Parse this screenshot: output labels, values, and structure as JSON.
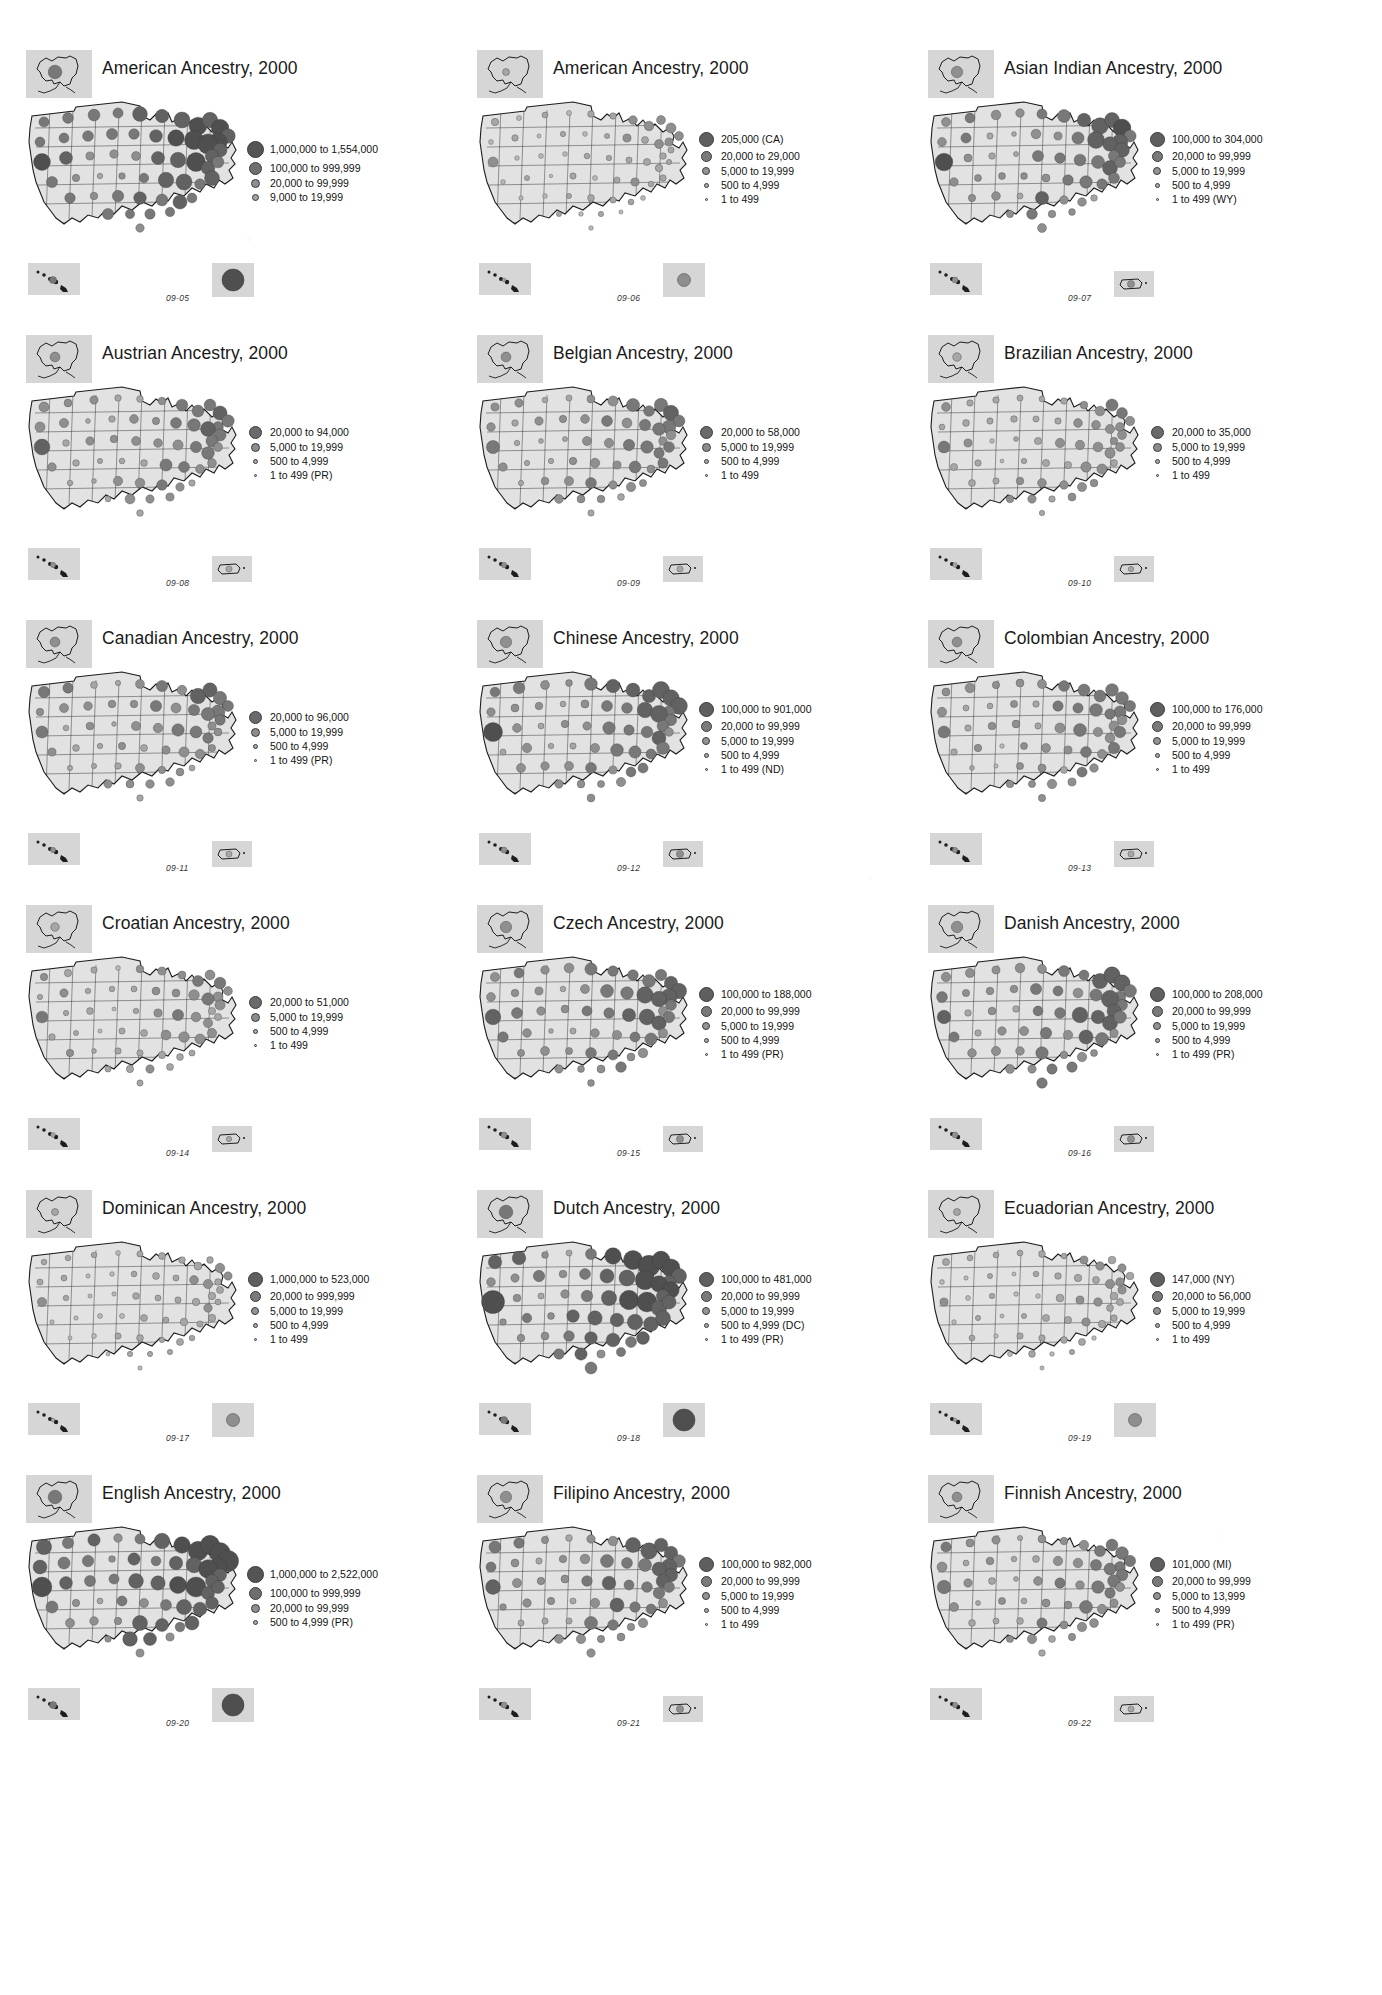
{
  "document": {
    "kind": "atlas-page",
    "description": "Grid of 18 proportional-symbol maps of U.S. ancestry populations by state, Census 2000"
  },
  "panels": [
    {
      "id": "09-05",
      "title": "American Ancestry, 2000",
      "fig_num": "09-05",
      "legend": [
        {
          "label": "1,000,000 to 1,554,000",
          "size": 17,
          "color": "#555555"
        },
        {
          "label": "100,000 to 999,999",
          "size": 13,
          "color": "#6e6e6e"
        },
        {
          "label": "20,000 to 99,999",
          "size": 9,
          "color": "#8e8e8e"
        },
        {
          "label": "9,000 to 19,999",
          "size": 7,
          "color": "#a3a3a3"
        }
      ],
      "insets": [
        "hawaii",
        "puerto-rico"
      ],
      "density": "very-high"
    },
    {
      "id": "09-06",
      "title": "American Ancestry, 2000",
      "fig_num": "09-06",
      "legend": [
        {
          "label": "205,000 (CA)",
          "size": 15,
          "color": "#5f5f5f"
        },
        {
          "label": "20,000 to 29,000",
          "size": 11,
          "color": "#7a7a7a"
        },
        {
          "label": "5,000 to 19,999",
          "size": 8,
          "color": "#949494"
        },
        {
          "label": "500 to 4,999",
          "size": 5,
          "color": "#ababab"
        },
        {
          "label": "1 to 499",
          "size": 3,
          "color": "#bdbdbd"
        }
      ],
      "insets": [
        "hawaii",
        "puerto-rico"
      ],
      "density": "low"
    },
    {
      "id": "09-07",
      "title": "Asian Indian Ancestry, 2000",
      "fig_num": "09-07",
      "legend": [
        {
          "label": "100,000 to 304,000",
          "size": 15,
          "color": "#5f5f5f"
        },
        {
          "label": "20,000 to 99,999",
          "size": 11,
          "color": "#7a7a7a"
        },
        {
          "label": "5,000 to 19,999",
          "size": 8,
          "color": "#949494"
        },
        {
          "label": "500 to 4,999",
          "size": 5,
          "color": "#ababab"
        },
        {
          "label": "1 to 499 (WY)",
          "size": 3,
          "color": "#bdbdbd"
        }
      ],
      "insets": [
        "hawaii",
        "puerto-rico"
      ],
      "density": "medium-high"
    },
    {
      "id": "09-08",
      "title": "Austrian Ancestry, 2000",
      "fig_num": "09-08",
      "legend": [
        {
          "label": "20,000 to 94,000",
          "size": 13,
          "color": "#6a6a6a"
        },
        {
          "label": "5,000 to 19,999",
          "size": 9,
          "color": "#8c8c8c"
        },
        {
          "label": "500 to 4,999",
          "size": 5,
          "color": "#ababab"
        },
        {
          "label": "1 to 499 (PR)",
          "size": 3,
          "color": "#bdbdbd"
        }
      ],
      "insets": [
        "hawaii",
        "puerto-rico"
      ],
      "density": "medium"
    },
    {
      "id": "09-09",
      "title": "Belgian Ancestry, 2000",
      "fig_num": "09-09",
      "legend": [
        {
          "label": "20,000 to 58,000",
          "size": 13,
          "color": "#6a6a6a"
        },
        {
          "label": "5,000 to 19,999",
          "size": 9,
          "color": "#8c8c8c"
        },
        {
          "label": "500 to 4,999",
          "size": 5,
          "color": "#ababab"
        },
        {
          "label": "1 to 499",
          "size": 3,
          "color": "#bdbdbd"
        }
      ],
      "insets": [
        "hawaii",
        "puerto-rico"
      ],
      "density": "medium"
    },
    {
      "id": "09-10",
      "title": "Brazilian Ancestry, 2000",
      "fig_num": "09-10",
      "legend": [
        {
          "label": "20,000 to 35,000",
          "size": 13,
          "color": "#6a6a6a"
        },
        {
          "label": "5,000 to 19,999",
          "size": 9,
          "color": "#8c8c8c"
        },
        {
          "label": "500 to 4,999",
          "size": 5,
          "color": "#ababab"
        },
        {
          "label": "1 to 499",
          "size": 3,
          "color": "#bdbdbd"
        }
      ],
      "insets": [
        "hawaii",
        "puerto-rico"
      ],
      "density": "medium-low"
    },
    {
      "id": "09-11",
      "title": "Canadian Ancestry, 2000",
      "fig_num": "09-11",
      "legend": [
        {
          "label": "20,000 to 96,000",
          "size": 13,
          "color": "#6a6a6a"
        },
        {
          "label": "5,000 to 19,999",
          "size": 9,
          "color": "#8c8c8c"
        },
        {
          "label": "500 to 4,999",
          "size": 5,
          "color": "#ababab"
        },
        {
          "label": "1 to 499 (PR)",
          "size": 3,
          "color": "#bdbdbd"
        }
      ],
      "insets": [
        "hawaii",
        "puerto-rico"
      ],
      "density": "medium"
    },
    {
      "id": "09-12",
      "title": "Chinese Ancestry, 2000",
      "fig_num": "09-12",
      "legend": [
        {
          "label": "100,000 to 901,000",
          "size": 15,
          "color": "#5f5f5f"
        },
        {
          "label": "20,000 to 99,999",
          "size": 11,
          "color": "#7a7a7a"
        },
        {
          "label": "5,000 to 19,999",
          "size": 8,
          "color": "#949494"
        },
        {
          "label": "500 to 4,999",
          "size": 5,
          "color": "#ababab"
        },
        {
          "label": "1 to 499 (ND)",
          "size": 3,
          "color": "#bdbdbd"
        }
      ],
      "insets": [
        "hawaii",
        "puerto-rico"
      ],
      "density": "medium-high"
    },
    {
      "id": "09-13",
      "title": "Colombian Ancestry, 2000",
      "fig_num": "09-13",
      "legend": [
        {
          "label": "100,000 to 176,000",
          "size": 15,
          "color": "#5f5f5f"
        },
        {
          "label": "20,000 to 99,999",
          "size": 11,
          "color": "#7a7a7a"
        },
        {
          "label": "5,000 to 19,999",
          "size": 8,
          "color": "#949494"
        },
        {
          "label": "500 to 4,999",
          "size": 5,
          "color": "#ababab"
        },
        {
          "label": "1 to 499",
          "size": 3,
          "color": "#bdbdbd"
        }
      ],
      "insets": [
        "hawaii",
        "puerto-rico"
      ],
      "density": "medium"
    },
    {
      "id": "09-14",
      "title": "Croatian Ancestry, 2000",
      "fig_num": "09-14",
      "legend": [
        {
          "label": "20,000 to 51,000",
          "size": 13,
          "color": "#6a6a6a"
        },
        {
          "label": "5,000 to 19,999",
          "size": 9,
          "color": "#8c8c8c"
        },
        {
          "label": "500 to 4,999",
          "size": 5,
          "color": "#ababab"
        },
        {
          "label": "1 to 499",
          "size": 3,
          "color": "#bdbdbd"
        }
      ],
      "insets": [
        "hawaii",
        "puerto-rico"
      ],
      "density": "medium-low"
    },
    {
      "id": "09-15",
      "title": "Czech Ancestry, 2000",
      "fig_num": "09-15",
      "legend": [
        {
          "label": "100,000 to 188,000",
          "size": 15,
          "color": "#5f5f5f"
        },
        {
          "label": "20,000 to 99,999",
          "size": 11,
          "color": "#7a7a7a"
        },
        {
          "label": "5,000 to 19,999",
          "size": 8,
          "color": "#949494"
        },
        {
          "label": "500 to 4,999",
          "size": 5,
          "color": "#ababab"
        },
        {
          "label": "1 to 499 (PR)",
          "size": 3,
          "color": "#bdbdbd"
        }
      ],
      "insets": [
        "hawaii",
        "puerto-rico"
      ],
      "density": "medium-high"
    },
    {
      "id": "09-16",
      "title": "Danish Ancestry, 2000",
      "fig_num": "09-16",
      "legend": [
        {
          "label": "100,000 to 208,000",
          "size": 15,
          "color": "#5f5f5f"
        },
        {
          "label": "20,000 to 99,999",
          "size": 11,
          "color": "#7a7a7a"
        },
        {
          "label": "5,000 to 19,999",
          "size": 8,
          "color": "#949494"
        },
        {
          "label": "500 to 4,999",
          "size": 5,
          "color": "#ababab"
        },
        {
          "label": "1 to 499 (PR)",
          "size": 3,
          "color": "#bdbdbd"
        }
      ],
      "insets": [
        "hawaii",
        "puerto-rico"
      ],
      "density": "medium-high"
    },
    {
      "id": "09-17",
      "title": "Dominican Ancestry, 2000",
      "fig_num": "09-17",
      "legend": [
        {
          "label": "1,000,000 to 523,000",
          "size": 15,
          "color": "#5f5f5f"
        },
        {
          "label": "20,000 to 999,999",
          "size": 11,
          "color": "#7a7a7a"
        },
        {
          "label": "5,000 to 19,999",
          "size": 8,
          "color": "#949494"
        },
        {
          "label": "500 to 4,999",
          "size": 5,
          "color": "#ababab"
        },
        {
          "label": "1 to 499",
          "size": 3,
          "color": "#bdbdbd"
        }
      ],
      "insets": [
        "hawaii",
        "puerto-rico"
      ],
      "density": "low"
    },
    {
      "id": "09-18",
      "title": "Dutch Ancestry, 2000",
      "fig_num": "09-18",
      "legend": [
        {
          "label": "100,000 to 481,000",
          "size": 15,
          "color": "#5f5f5f"
        },
        {
          "label": "20,000 to 99,999",
          "size": 11,
          "color": "#7a7a7a"
        },
        {
          "label": "5,000 to 19,999",
          "size": 8,
          "color": "#949494"
        },
        {
          "label": "500 to 4,999 (DC)",
          "size": 5,
          "color": "#ababab"
        },
        {
          "label": "1 to 499 (PR)",
          "size": 3,
          "color": "#bdbdbd"
        }
      ],
      "insets": [
        "hawaii",
        "puerto-rico"
      ],
      "density": "very-high"
    },
    {
      "id": "09-19",
      "title": "Ecuadorian Ancestry, 2000",
      "fig_num": "09-19",
      "legend": [
        {
          "label": "147,000 (NY)",
          "size": 15,
          "color": "#5f5f5f"
        },
        {
          "label": "20,000 to 56,000",
          "size": 11,
          "color": "#7a7a7a"
        },
        {
          "label": "5,000 to 19,999",
          "size": 8,
          "color": "#949494"
        },
        {
          "label": "500 to 4,999",
          "size": 5,
          "color": "#ababab"
        },
        {
          "label": "1 to 499",
          "size": 3,
          "color": "#bdbdbd"
        }
      ],
      "insets": [
        "hawaii",
        "puerto-rico"
      ],
      "density": "low"
    },
    {
      "id": "09-20",
      "title": "English Ancestry, 2000",
      "fig_num": "09-20",
      "legend": [
        {
          "label": "1,000,000 to 2,522,000",
          "size": 17,
          "color": "#555555"
        },
        {
          "label": "100,000 to 999,999",
          "size": 13,
          "color": "#6e6e6e"
        },
        {
          "label": "20,000 to 99,999",
          "size": 9,
          "color": "#8e8e8e"
        },
        {
          "label": "500 to 4,999 (PR)",
          "size": 5,
          "color": "#ababab"
        }
      ],
      "insets": [
        "hawaii",
        "puerto-rico"
      ],
      "density": "very-high"
    },
    {
      "id": "09-21",
      "title": "Filipino Ancestry, 2000",
      "fig_num": "09-21",
      "legend": [
        {
          "label": "100,000 to 982,000",
          "size": 15,
          "color": "#5f5f5f"
        },
        {
          "label": "20,000 to 99,999",
          "size": 11,
          "color": "#7a7a7a"
        },
        {
          "label": "5,000 to 19,999",
          "size": 8,
          "color": "#949494"
        },
        {
          "label": "500 to 4,999",
          "size": 5,
          "color": "#ababab"
        },
        {
          "label": "1 to 499",
          "size": 3,
          "color": "#bdbdbd"
        }
      ],
      "insets": [
        "hawaii",
        "puerto-rico"
      ],
      "density": "medium-high"
    },
    {
      "id": "09-22",
      "title": "Finnish Ancestry, 2000",
      "fig_num": "09-22",
      "legend": [
        {
          "label": "101,000 (MI)",
          "size": 15,
          "color": "#5f5f5f"
        },
        {
          "label": "20,000 to 99,999",
          "size": 11,
          "color": "#7a7a7a"
        },
        {
          "label": "5,000 to 13,999",
          "size": 8,
          "color": "#949494"
        },
        {
          "label": "500 to 4,999",
          "size": 5,
          "color": "#ababab"
        },
        {
          "label": "1 to 499 (PR)",
          "size": 3,
          "color": "#bdbdbd"
        }
      ],
      "insets": [
        "hawaii",
        "puerto-rico"
      ],
      "density": "medium"
    }
  ],
  "style": {
    "state_fill": "#e2e2e2",
    "state_stroke": "#1d1d1d",
    "inset_bg": "#d6d6d6",
    "page_bg": "#ffffff",
    "text_color": "#1a1a1a"
  }
}
